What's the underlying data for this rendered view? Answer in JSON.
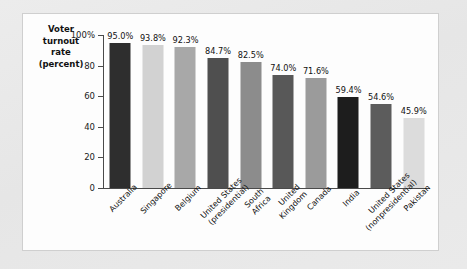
{
  "figure": {
    "axis_title_lines": [
      "Voter",
      "turnout",
      "rate",
      "(percent)"
    ]
  },
  "chart_data": {
    "type": "bar",
    "title": "",
    "subtitle": "",
    "xlabel": "",
    "ylabel": "Voter turnout rate (percent)",
    "ylim": [
      0,
      100
    ],
    "grid": false,
    "legend": "none",
    "ytick_labels": [
      "100%",
      "80",
      "60",
      "40",
      "20",
      "0"
    ],
    "ytick_values": [
      100,
      80,
      60,
      40,
      20,
      0
    ],
    "categories": [
      "Australia",
      "Singapore",
      "Belgium",
      "United States (presidential)",
      "South Africa",
      "United Kingdom",
      "Canada",
      "India",
      "United States (nonpresidential)",
      "Pakistan"
    ],
    "category_lines": [
      [
        "Australia"
      ],
      [
        "Singapore"
      ],
      [
        "Belgium"
      ],
      [
        "United States",
        "(presidential)"
      ],
      [
        "South",
        "Africa"
      ],
      [
        "United",
        "Kingdom"
      ],
      [
        "Canada"
      ],
      [
        "India"
      ],
      [
        "United States",
        "(nonpresidential)"
      ],
      [
        "Pakistan"
      ]
    ],
    "values": [
      95.0,
      93.8,
      92.3,
      84.7,
      82.5,
      74.0,
      71.6,
      59.4,
      54.6,
      45.9
    ],
    "value_labels": [
      "95.0%",
      "93.8%",
      "92.3%",
      "84.7%",
      "82.5%",
      "74.0%",
      "71.6%",
      "59.4%",
      "54.6%",
      "45.9%"
    ],
    "bar_colors": [
      "#2e2e2e",
      "#d2d2d2",
      "#a8a8a8",
      "#4f4f4f",
      "#8c8c8c",
      "#585858",
      "#9b9b9b",
      "#1d1d1d",
      "#5c5c5c",
      "#dcdcdc"
    ]
  }
}
